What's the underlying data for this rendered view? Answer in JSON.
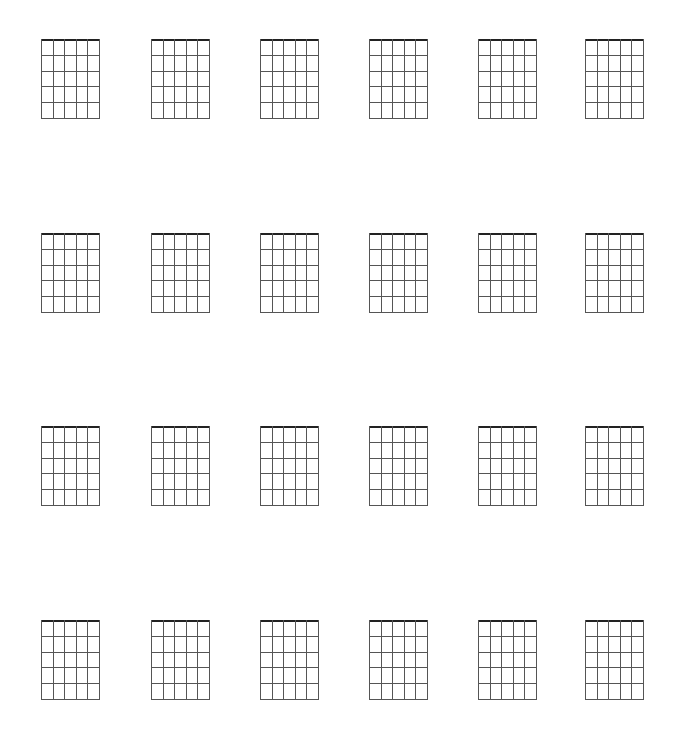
{
  "sheet": {
    "title": "",
    "rows": 4,
    "columns": 6,
    "strings": 6,
    "frets": 5,
    "column_x": [
      41,
      151,
      260,
      369,
      478,
      585
    ],
    "row_y": [
      39,
      233,
      426,
      620
    ],
    "diagram_width": 59,
    "diagram_height": 80,
    "line_color": "#555555",
    "nut_color": "#222222"
  }
}
